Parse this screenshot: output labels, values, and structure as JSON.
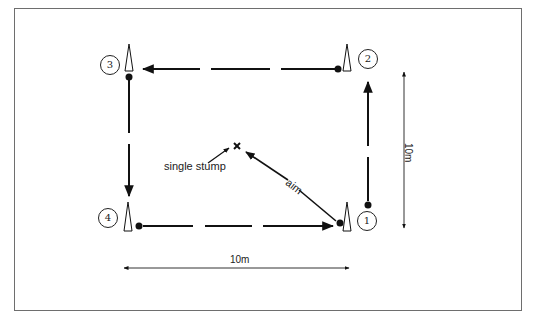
{
  "diagram": {
    "title": "",
    "stations": [
      {
        "id": "1",
        "label": "1"
      },
      {
        "id": "2",
        "label": "2"
      },
      {
        "id": "3",
        "label": "3"
      },
      {
        "id": "4",
        "label": "4"
      }
    ],
    "annotations": {
      "target": "single stump",
      "aim": "aim",
      "width_dimension": "10m",
      "height_dimension": "10m"
    },
    "colors": {
      "line": "#111111",
      "frame": "#6e6e6e",
      "background": "#ffffff"
    }
  }
}
